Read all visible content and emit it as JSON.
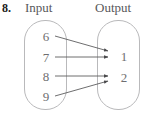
{
  "problem": {
    "number": "8."
  },
  "headers": {
    "input": "Input",
    "output": "Output"
  },
  "colors": {
    "number_text": "#1a1a1a",
    "header_text": "#58585a",
    "value_text": "#6e6e70",
    "oval_border": "#b9b9bb",
    "arrow_line": "#5d5d5f",
    "background": "#ffffff"
  },
  "diagram": {
    "type": "mapping-diagram",
    "input_values": [
      "6",
      "7",
      "8",
      "9"
    ],
    "output_values": [
      "1",
      "2"
    ],
    "mappings": [
      {
        "from": "6",
        "to": "1"
      },
      {
        "from": "7",
        "to": "1"
      },
      {
        "from": "8",
        "to": "2"
      },
      {
        "from": "9",
        "to": "2"
      }
    ]
  }
}
